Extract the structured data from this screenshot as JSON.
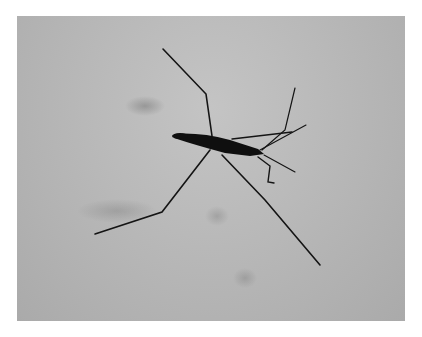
{
  "image": {
    "subject": "water strider on water surface",
    "style": "grayscale photograph",
    "colors": {
      "background": "#b8b8b8",
      "insect": "#111111",
      "frame": "#ffffff"
    }
  }
}
